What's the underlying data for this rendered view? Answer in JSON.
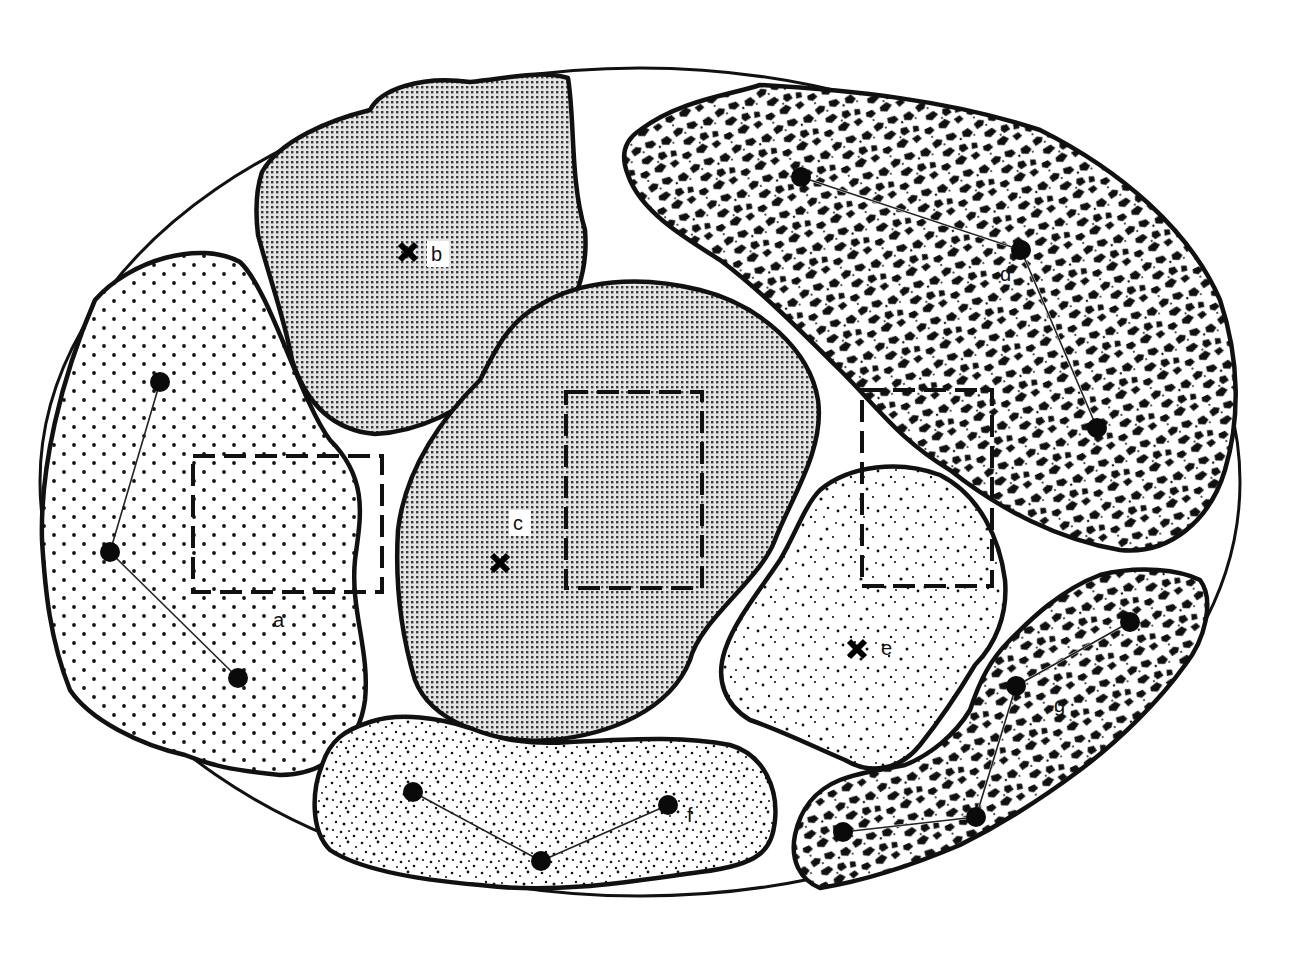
{
  "diagram": {
    "colors": {
      "ink": "#111111",
      "background": "#ffffff",
      "fine_stipple": "#555555"
    },
    "patches": [
      {
        "id": "a",
        "label": "a",
        "pattern": "regular-dot-grid",
        "marker": "none",
        "nodes": 3
      },
      {
        "id": "b",
        "label": "b",
        "pattern": "fine-wavy-dot-screen",
        "marker": "star-cross",
        "nodes": 0
      },
      {
        "id": "c",
        "label": "c",
        "pattern": "fine-wavy-dot-screen",
        "marker": "star-cross",
        "nodes": 0
      },
      {
        "id": "d",
        "label": "d",
        "pattern": "coarse-mottled",
        "marker": "none",
        "nodes": 3
      },
      {
        "id": "e",
        "label": "e",
        "pattern": "random-stipple",
        "marker": "star-cross",
        "nodes": 0
      },
      {
        "id": "f",
        "label": "f",
        "pattern": "dense-random-stipple",
        "marker": "none",
        "nodes": 3
      },
      {
        "id": "g",
        "label": "g",
        "pattern": "coarse-mottled",
        "marker": "none",
        "nodes": 4
      }
    ],
    "sample_boxes": [
      {
        "id": "box-a",
        "within": "a"
      },
      {
        "id": "box-c",
        "within": "c"
      },
      {
        "id": "box-de",
        "within": "d/e boundary"
      }
    ],
    "labels": {
      "a": "a",
      "b": "b",
      "c": "c",
      "d": "d",
      "e": "e",
      "f": "f",
      "g": "g"
    }
  }
}
